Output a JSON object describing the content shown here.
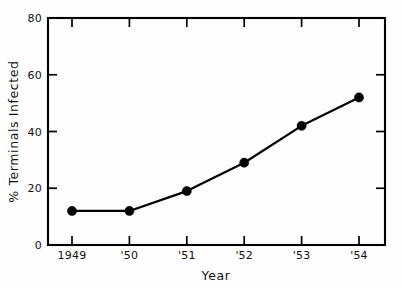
{
  "chart_data": {
    "type": "line",
    "title": "",
    "xlabel": "Year",
    "ylabel": "% Terminals Infected",
    "categories": [
      "1949",
      "'50",
      "'51",
      "'52",
      "'53",
      "'54"
    ],
    "values": [
      12,
      12,
      19,
      29,
      42,
      52
    ],
    "x": [
      1949,
      1950,
      1951,
      1952,
      1953,
      1954
    ],
    "xlim": [
      1948.5,
      1954.5
    ],
    "ylim": [
      0,
      80
    ],
    "ytick_labels": [
      "0",
      "20",
      "40",
      "60",
      "80"
    ],
    "ytick_values": [
      0,
      20,
      40,
      60,
      80
    ],
    "xtick_labels": [
      "1949",
      "'50",
      "'51",
      "'52",
      "'53",
      "'54"
    ],
    "grid": false,
    "legend": false,
    "legend_position": "none",
    "marker": "filled-circle",
    "series_color": "#000000",
    "background_color": "#fefefe",
    "annotations": []
  },
  "axes": {
    "y": {
      "label": "% Terminals Infected",
      "ticks": [
        {
          "label": "80",
          "value": 80
        },
        {
          "label": "60",
          "value": 60
        },
        {
          "label": "40",
          "value": 40
        },
        {
          "label": "20",
          "value": 20
        },
        {
          "label": "0",
          "value": 0
        }
      ]
    },
    "x": {
      "label": "Year",
      "ticks": [
        {
          "label": "1949",
          "value": 1949
        },
        {
          "label": "'50",
          "value": 1950
        },
        {
          "label": "'51",
          "value": 1951
        },
        {
          "label": "'52",
          "value": 1952
        },
        {
          "label": "'53",
          "value": 1953
        },
        {
          "label": "'54",
          "value": 1954
        }
      ]
    }
  }
}
